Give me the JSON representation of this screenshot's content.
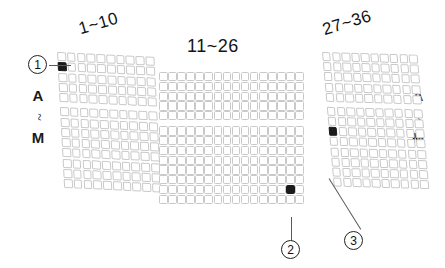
{
  "figure": {
    "background_color": "#ffffff",
    "cell_border_color": "#c9c9c9",
    "marker_color": "#1a1a1a",
    "leader_color": "#5a5a5a"
  },
  "axis_labels": {
    "left": {
      "start": "A",
      "separator": "~",
      "end": "M"
    },
    "right": {
      "start": "A",
      "separator": "~",
      "end": "M"
    }
  },
  "blocks": [
    {
      "id": "left",
      "title": "1~10",
      "columns": 10,
      "row_groups": [
        5,
        8
      ],
      "rows_total": 13,
      "filled_cell": {
        "group": 0,
        "row": 1,
        "col": 0
      }
    },
    {
      "id": "middle",
      "title": "11~26",
      "columns": 16,
      "row_groups": [
        5,
        8
      ],
      "rows_total": 13,
      "filled_cell": {
        "group": 1,
        "row": 6,
        "col": 14
      }
    },
    {
      "id": "right",
      "title": "27~36",
      "columns": 10,
      "row_groups": [
        5,
        8
      ],
      "rows_total": 13,
      "filled_cell": {
        "group": 1,
        "row": 2,
        "col": 0
      }
    }
  ],
  "callouts": [
    {
      "id": "callout-1",
      "label": "1"
    },
    {
      "id": "callout-2",
      "label": "2"
    },
    {
      "id": "callout-3",
      "label": "3"
    }
  ]
}
